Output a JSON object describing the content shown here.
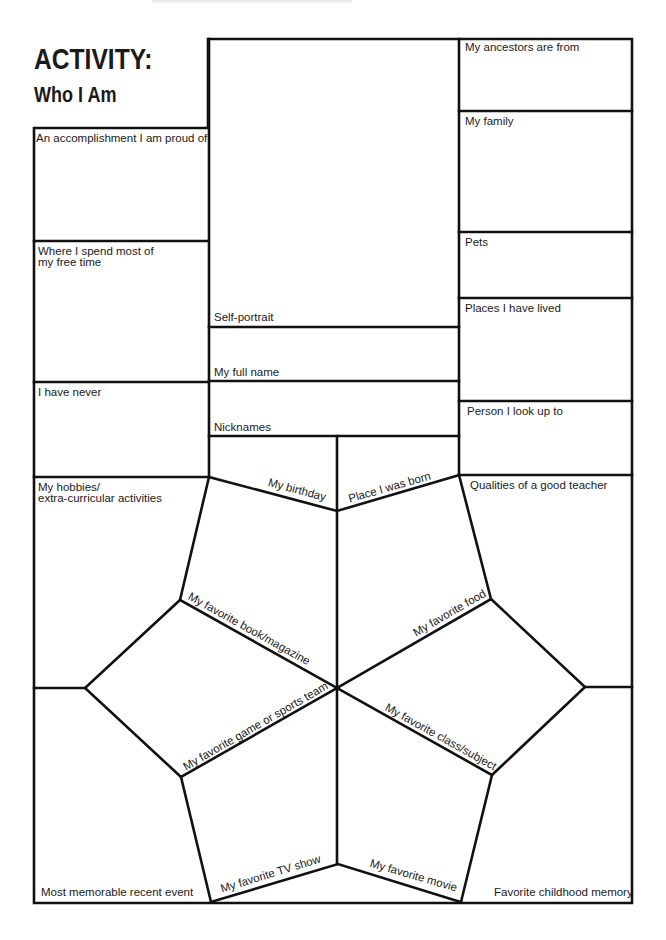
{
  "header": {
    "title": "ACTIVITY:",
    "subtitle": "Who I Am"
  },
  "left_column": [
    {
      "label": "An accomplishment I am proud of"
    },
    {
      "label_line1": "Where I spend most of",
      "label_line2": "my free time"
    },
    {
      "label": "I have never"
    },
    {
      "label_line1": "My hobbies/",
      "label_line2": "extra-curricular activities"
    },
    {
      "label": "Most memorable recent event"
    }
  ],
  "center_column": {
    "self_portrait": "Self-portrait",
    "full_name": "My full name",
    "nicknames": "Nicknames",
    "birthday": "My birthday",
    "place_born": "Place I was born",
    "book": "My favorite book/magazine",
    "food": "My favorite food",
    "game": "My favorite game or sports team",
    "class": "My favorite class/subject",
    "tv": "My  favorite TV show",
    "movie": "My favorite movie"
  },
  "right_column": [
    {
      "label": "My ancestors are from"
    },
    {
      "label": "My family"
    },
    {
      "label": "Pets"
    },
    {
      "label": "Places I have lived"
    },
    {
      "label": "Person I look up to"
    },
    {
      "label": "Qualities of a good teacher"
    },
    {
      "label": "Favorite childhood memory"
    }
  ],
  "colors": {
    "line": "#111111",
    "background": "#ffffff",
    "text": "#1a1a1a"
  }
}
